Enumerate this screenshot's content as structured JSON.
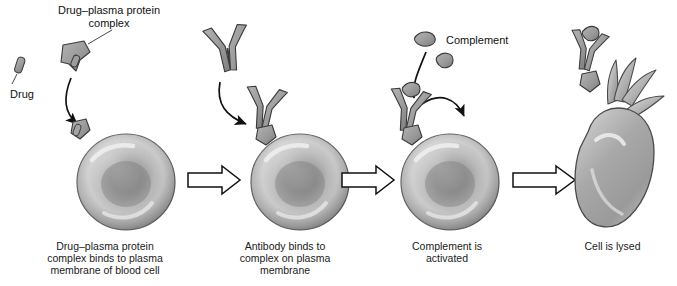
{
  "figure": {
    "background": "#ffffff",
    "ink": "#1a1a1a",
    "cell_fill_dark": "#8a8a8a",
    "cell_fill_light": "#d8d8d8",
    "protein_fill": "#9a9a9a"
  },
  "labels": {
    "drug": "Drug",
    "complex_line1": "Drug–plasma protein",
    "complex_line2": "complex",
    "complement": "Complement"
  },
  "panels": [
    {
      "id": "panel-1",
      "caption_lines": [
        "Drug–plasma protein",
        "complex binds to plasma",
        "membrane of blood cell"
      ]
    },
    {
      "id": "panel-2",
      "caption_lines": [
        "Antibody binds to",
        "complex on plasma",
        "membrane"
      ]
    },
    {
      "id": "panel-3",
      "caption_lines": [
        "Complement is",
        "activated"
      ]
    },
    {
      "id": "panel-4",
      "caption_lines": [
        "Cell is lysed"
      ]
    }
  ],
  "arrows": [
    {
      "id": "step-arrow-1"
    },
    {
      "id": "step-arrow-2"
    },
    {
      "id": "step-arrow-3"
    }
  ]
}
